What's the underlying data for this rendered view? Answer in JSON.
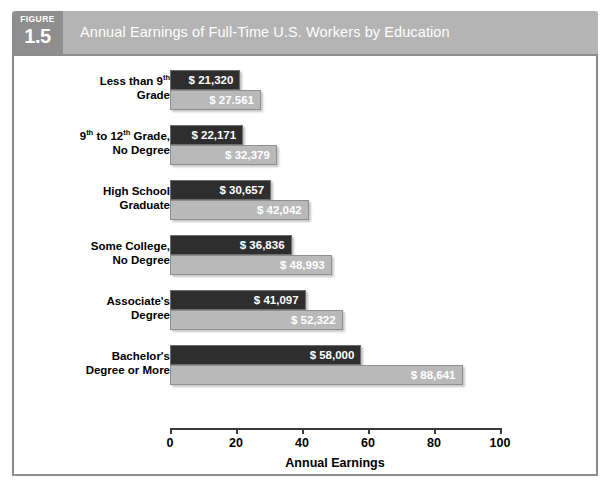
{
  "figure": {
    "badge_word": "FIGURE",
    "badge_number": "1.5",
    "title": "Annual Earnings of Full-Time U.S. Workers by Education"
  },
  "chart_data": {
    "type": "bar",
    "orientation": "horizontal",
    "title": "Annual Earnings of Full-Time U.S. Workers by Education",
    "xlabel": "Annual Earnings",
    "ylabel": "",
    "xlim": [
      0,
      100
    ],
    "xticks": [
      0,
      20,
      40,
      60,
      80,
      100
    ],
    "xtick_labels": [
      "0",
      "20",
      "40",
      "60",
      "80",
      "100"
    ],
    "grid": false,
    "legend": "none",
    "units_note": "thousands of dollars",
    "categories": [
      "Less than 9th Grade",
      "9th to 12th Grade, No Degree",
      "High School Graduate",
      "Some College, No Degree",
      "Associate's Degree",
      "Bachelor's Degree or More"
    ],
    "series": [
      {
        "name": "dark",
        "color": "#2e2e2e",
        "values": [
          21.32,
          22.171,
          30.657,
          36.836,
          41.097,
          58.0
        ],
        "labels": [
          "$ 21,320",
          "$ 22,171",
          "$ 30,657",
          "$ 36,836",
          "$ 41,097",
          "$ 58,000"
        ]
      },
      {
        "name": "light",
        "color": "#b9b9b9",
        "values": [
          27.561,
          32.379,
          42.042,
          48.993,
          52.322,
          88.641
        ],
        "labels": [
          "$ 27.561",
          "$ 32,379",
          "$ 42,042",
          "$ 48,993",
          "$ 52,322",
          "$ 88,641"
        ]
      }
    ]
  },
  "groups": [
    {
      "label_line1": "Less than 9",
      "label_sup1": "th",
      "label_line2": "Grade",
      "dark_label": "$ 21,320",
      "light_label": "$ 27.561"
    },
    {
      "label_line1": "9",
      "label_sup1": "th",
      "label_mid": " to 12",
      "label_sup2": "th",
      "label_tail": " Grade,",
      "label_line2": "No Degree",
      "dark_label": "$ 22,171",
      "light_label": "$ 32,379"
    },
    {
      "label_line1": "High School",
      "label_line2": "Graduate",
      "dark_label": "$ 30,657",
      "light_label": "$ 42,042"
    },
    {
      "label_line1": "Some College,",
      "label_line2": "No Degree",
      "dark_label": "$ 36,836",
      "light_label": "$ 48,993"
    },
    {
      "label_line1": "Associate's",
      "label_line2": "Degree",
      "dark_label": "$ 41,097",
      "light_label": "$ 52,322"
    },
    {
      "label_line1": "Bachelor's",
      "label_line2": "Degree or More",
      "dark_label": "$ 58,000",
      "light_label": "$ 88,641"
    }
  ],
  "axis": {
    "tick_labels": [
      "0",
      "20",
      "40",
      "60",
      "80",
      "100"
    ],
    "title": "Annual Earnings"
  },
  "colors": {
    "header_band": "#b4b4b4",
    "badge": "#8e8e8e",
    "bar_dark": "#2e2e2e",
    "bar_light": "#b9b9b9",
    "frame_border": "#8c8c8c"
  }
}
